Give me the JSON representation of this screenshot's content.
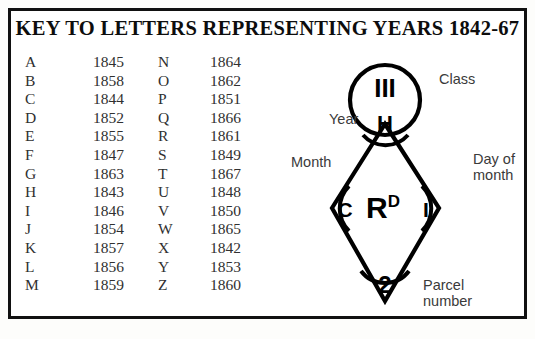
{
  "title": "KEY TO LETTERS REPRESENTING YEARS 1842-67",
  "key_table": {
    "rows": [
      {
        "letter_a": "A",
        "year_a": "1845",
        "letter_b": "N",
        "year_b": "1864"
      },
      {
        "letter_a": "B",
        "year_a": "1858",
        "letter_b": "O",
        "year_b": "1862"
      },
      {
        "letter_a": "C",
        "year_a": "1844",
        "letter_b": "P",
        "year_b": "1851"
      },
      {
        "letter_a": "D",
        "year_a": "1852",
        "letter_b": "Q",
        "year_b": "1866"
      },
      {
        "letter_a": "E",
        "year_a": "1855",
        "letter_b": "R",
        "year_b": "1861"
      },
      {
        "letter_a": "F",
        "year_a": "1847",
        "letter_b": "S",
        "year_b": "1849"
      },
      {
        "letter_a": "G",
        "year_a": "1863",
        "letter_b": "T",
        "year_b": "1867"
      },
      {
        "letter_a": "H",
        "year_a": "1843",
        "letter_b": "U",
        "year_b": "1848"
      },
      {
        "letter_a": "I",
        "year_a": "1846",
        "letter_b": "V",
        "year_b": "1850"
      },
      {
        "letter_a": "J",
        "year_a": "1854",
        "letter_b": "W",
        "year_b": "1865"
      },
      {
        "letter_a": "K",
        "year_a": "1857",
        "letter_b": "X",
        "year_b": "1842"
      },
      {
        "letter_a": "L",
        "year_a": "1856",
        "letter_b": "Y",
        "year_b": "1853"
      },
      {
        "letter_a": "M",
        "year_a": "1859",
        "letter_b": "Z",
        "year_b": "1860"
      }
    ]
  },
  "diagram": {
    "class_value": "III",
    "year_value": "H",
    "month_value": "C",
    "day_value": "I",
    "parcel_value": "2",
    "center_letter": "R",
    "center_superscript": "D",
    "labels": {
      "class": "Class",
      "year": "Year",
      "month": "Month",
      "day_line1": "Day of",
      "day_line2": "month",
      "parcel_line1": "Parcel",
      "parcel_line2": "number"
    }
  },
  "colors": {
    "ink": "#111111",
    "paper": "#ffffff",
    "label_text": "#3a3a3a"
  }
}
